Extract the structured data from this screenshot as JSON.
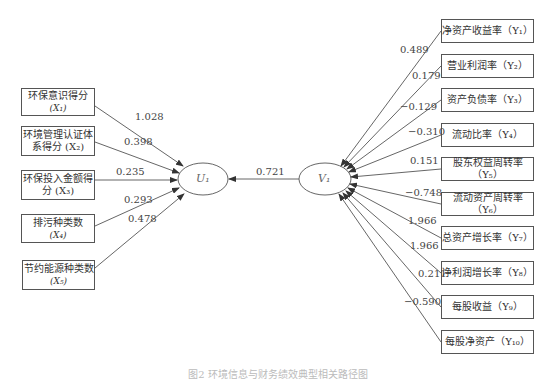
{
  "left_variables": [
    {
      "label": "环保意识得分",
      "symbol": "(X₁)",
      "coef": "1.028"
    },
    {
      "label": "环境管理认证体",
      "label2": "系得分 (X₂)",
      "coef": "0.398"
    },
    {
      "label": "环保投入金额得",
      "label2": "分 (X₃)",
      "coef": "0.235"
    },
    {
      "label": "排污种类数",
      "symbol": "(X₄)",
      "coef": "0.293"
    },
    {
      "label": "节约能源种类数",
      "symbol": "(X₅)",
      "coef": "0.478"
    }
  ],
  "left_node": {
    "label": "U₁"
  },
  "right_node": {
    "label": "V₁"
  },
  "canonical_correlation": "0.721",
  "right_variables": [
    {
      "label": "净资产收益率（Y₁）",
      "coef": "0.489"
    },
    {
      "label": "营业利润率（Y₂）",
      "coef": "0.179"
    },
    {
      "label": "资产负债率（Y₃）",
      "coef": "−0.129"
    },
    {
      "label": "流动比率（Y₄）",
      "coef": "−0.310"
    },
    {
      "label": "股东权益周转率（Y₅）",
      "coef": "0.151"
    },
    {
      "label": "流动资产周转率（Y₆）",
      "coef": "−0.748"
    },
    {
      "label": "总资产增长率（Y₇）",
      "coef": "1.966"
    },
    {
      "label": "净利润增长率（Y₈）",
      "coef": "1.966"
    },
    {
      "label": "每股收益（Y₉）",
      "coef": "0.211"
    },
    {
      "label": "每股净资产（Y₁₀）",
      "coef": "−0.590"
    }
  ],
  "caption": "图2 环境信息与财务绩效典型相关路径图"
}
